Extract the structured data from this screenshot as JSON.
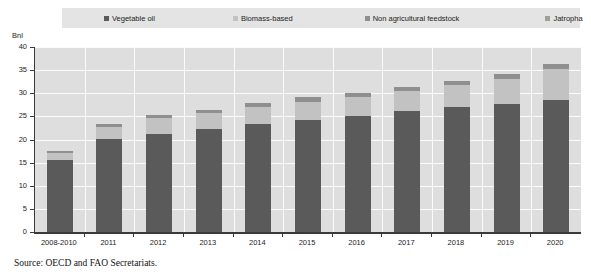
{
  "chart_data": {
    "type": "bar",
    "subtype": "stacked-bar",
    "title": "",
    "xlabel": "",
    "ylabel": "Bnl",
    "ylim": [
      0,
      40
    ],
    "ytick_step": 5,
    "yticks": [
      0,
      5,
      10,
      15,
      20,
      25,
      30,
      35,
      40
    ],
    "grid": true,
    "legend_position": "top",
    "categories": [
      "2008-2010",
      "2011",
      "2012",
      "2013",
      "2014",
      "2015",
      "2016",
      "2017",
      "2018",
      "2019",
      "2020"
    ],
    "series": [
      {
        "name": "Vegetable oil",
        "color": "#5a5a5a",
        "values": [
          15.5,
          20.1,
          21.2,
          22.2,
          23.3,
          24.2,
          25.0,
          26.1,
          27.1,
          27.7,
          28.5
        ]
      },
      {
        "name": "Biomass-based",
        "color": "#c2c2c2",
        "values": [
          1.6,
          2.7,
          3.4,
          3.5,
          3.7,
          4.0,
          4.1,
          4.3,
          4.6,
          5.3,
          6.7
        ]
      },
      {
        "name": "Non agricultural feedstock",
        "color": "#8f8f8f",
        "values": [
          0.4,
          0.6,
          0.7,
          0.7,
          0.8,
          0.9,
          0.9,
          1.0,
          1.0,
          1.1,
          1.2
        ]
      },
      {
        "name": "Jatropha",
        "color": "#9e9e9e",
        "values": [
          0.0,
          0.0,
          0.0,
          0.0,
          0.0,
          0.0,
          0.0,
          0.0,
          0.0,
          0.0,
          0.0
        ]
      }
    ],
    "totals": [
      17.5,
      23.4,
      25.3,
      26.4,
      27.8,
      29.1,
      30.0,
      31.4,
      32.7,
      34.1,
      36.4
    ]
  },
  "legend": {
    "items": [
      {
        "label": "Vegetable oil",
        "color": "#5a5a5a"
      },
      {
        "label": "Biomass-based",
        "color": "#c2c2c2"
      },
      {
        "label": "Non agricultural feedstock",
        "color": "#8f8f8f"
      },
      {
        "label": "Jatropha",
        "color": "#9e9e9e"
      }
    ]
  },
  "axis": {
    "unit_label": "Bnl"
  },
  "footer": {
    "source": "Source: OECD and FAO Secretariats."
  }
}
